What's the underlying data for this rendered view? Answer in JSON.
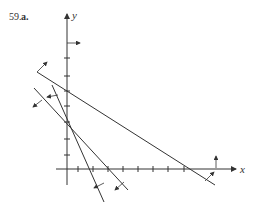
{
  "problem": {
    "number": "59.",
    "part": "a."
  },
  "axes": {
    "x_label": "x",
    "y_label": "y",
    "origin": [
      67,
      169
    ],
    "x_ticks_px": [
      78,
      93,
      108,
      123,
      138,
      153,
      168,
      184
    ],
    "y_ticks_px": [
      58,
      76,
      91,
      106,
      122,
      139,
      155
    ],
    "color": "#333333"
  },
  "lines": [
    {
      "name": "line-1",
      "from": [
        37,
        72
      ],
      "to": [
        215,
        185
      ],
      "shade_arrow": {
        "from": [
          37,
          72
        ],
        "to": [
          47,
          62
        ]
      }
    },
    {
      "name": "line-2",
      "from": [
        52,
        85
      ],
      "to": [
        104,
        202
      ],
      "shade_arrow": {
        "from": [
          58,
          95
        ],
        "to": [
          47,
          97
        ]
      }
    },
    {
      "name": "line-3",
      "from": [
        34,
        88
      ],
      "to": [
        128,
        190
      ],
      "shade_arrow": {
        "from": [
          42,
          100
        ],
        "to": [
          33,
          107
        ]
      }
    }
  ],
  "boundary_arrows": [
    {
      "name": "y-axis-right-arrow",
      "from": [
        67,
        43
      ],
      "to": [
        80,
        43
      ]
    },
    {
      "name": "x-axis-up-arrow",
      "from": [
        216,
        168
      ],
      "to": [
        216,
        156
      ]
    },
    {
      "name": "line-2-bottom-arrow",
      "from": [
        104,
        183
      ],
      "to": [
        94,
        188
      ]
    },
    {
      "name": "line-3-bottom-arrow",
      "from": [
        124,
        182
      ],
      "to": [
        115,
        190
      ]
    },
    {
      "name": "line-1-bottom-arrow",
      "from": [
        205,
        181
      ],
      "to": [
        214,
        172
      ]
    }
  ]
}
